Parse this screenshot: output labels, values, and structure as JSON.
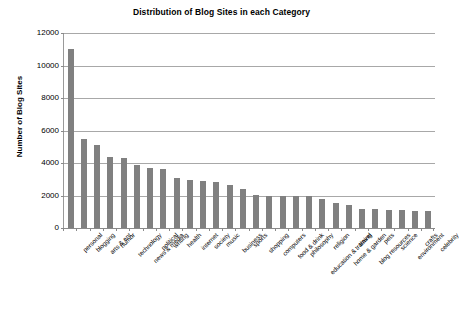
{
  "chart_data": {
    "type": "bar",
    "title": "Distribution of Blog Sites in each Category",
    "xlabel": "",
    "ylabel": "Number of Blog Sites",
    "ylim": [
      0,
      12000
    ],
    "yticks": [
      0,
      2000,
      4000,
      6000,
      8000,
      10000,
      12000
    ],
    "ytick_labels": [
      "0",
      "2000",
      "4000",
      "6000",
      "8000",
      "10000",
      "12000"
    ],
    "grid": true,
    "legend": false,
    "bar_color": "#808080",
    "categories": [
      "personal",
      "blogging",
      "arts & ent",
      "humor",
      "technology",
      "news & media",
      "political",
      "writing",
      "health",
      "internet",
      "society",
      "music",
      "business",
      "sports",
      "shopping",
      "computers",
      "food & drink",
      "philosophy",
      "education & training",
      "religion",
      "home & garden",
      "travel",
      "blog resources",
      "pets",
      "science",
      "environment",
      "crafts",
      "celebrity"
    ],
    "values": [
      11000,
      5500,
      5100,
      4400,
      4300,
      3900,
      3700,
      3650,
      3050,
      2950,
      2900,
      2850,
      2650,
      2400,
      2050,
      2000,
      2000,
      2000,
      2000,
      1800,
      1550,
      1400,
      1200,
      1150,
      1100,
      1100,
      1050,
      1050
    ]
  }
}
